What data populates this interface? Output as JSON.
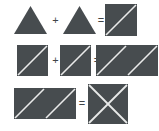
{
  "figure": {
    "type": "geometric-equation",
    "background_color": "#ffffff",
    "fill_color": "#474c4f",
    "split_line_color": "#e9eaea",
    "operator_color": "#3f4447",
    "rows": [
      {
        "id": "row-1",
        "equation": "triangle + triangle = square-split-diagonal",
        "items": [
          {
            "kind": "triangle-up",
            "label": "triangle-up-1",
            "x": 14,
            "y": 6,
            "w": 33,
            "h": 28
          },
          {
            "kind": "operator",
            "label": "+",
            "x": 50,
            "y": 15,
            "size": 11
          },
          {
            "kind": "triangle-up",
            "label": "triangle-up-2",
            "x": 63,
            "y": 6,
            "w": 33,
            "h": 28
          },
          {
            "kind": "operator",
            "label": "=",
            "x": 96,
            "y": 15,
            "size": 11
          },
          {
            "kind": "square-diagonal-up",
            "label": "square-diagonal-1",
            "x": 105,
            "y": 4,
            "w": 32,
            "h": 32
          }
        ]
      },
      {
        "id": "row-2",
        "equation": "half-square + half-square = two squares",
        "items": [
          {
            "kind": "square-diagonal-up",
            "label": "square-diagonal-2",
            "x": 17,
            "y": 45,
            "w": 31,
            "h": 31
          },
          {
            "kind": "operator",
            "label": "+",
            "x": 50,
            "y": 55,
            "size": 11
          },
          {
            "kind": "square-diagonal-up",
            "label": "square-diagonal-3",
            "x": 60,
            "y": 45,
            "w": 31,
            "h": 31
          },
          {
            "kind": "operator",
            "label": "=",
            "x": 93,
            "y": 55,
            "size": 11
          },
          {
            "kind": "square-diagonal-up",
            "label": "square-diagonal-4",
            "x": 96,
            "y": 45,
            "w": 31,
            "h": 31
          },
          {
            "kind": "square-diagonal-up",
            "label": "square-diagonal-5",
            "x": 127,
            "y": 45,
            "w": 31,
            "h": 31
          }
        ]
      },
      {
        "id": "row-3",
        "equation": "square + square = square-with-x",
        "items": [
          {
            "kind": "square-diagonal-up",
            "label": "square-diagonal-6",
            "x": 14,
            "y": 88,
            "w": 31,
            "h": 31
          },
          {
            "kind": "square-diagonal-up",
            "label": "square-diagonal-7",
            "x": 45,
            "y": 88,
            "w": 31,
            "h": 31
          },
          {
            "kind": "operator",
            "label": "=",
            "x": 78,
            "y": 98,
            "size": 11
          },
          {
            "kind": "square-x",
            "label": "square-x-1",
            "x": 88,
            "y": 84,
            "w": 40,
            "h": 40
          }
        ]
      }
    ]
  }
}
